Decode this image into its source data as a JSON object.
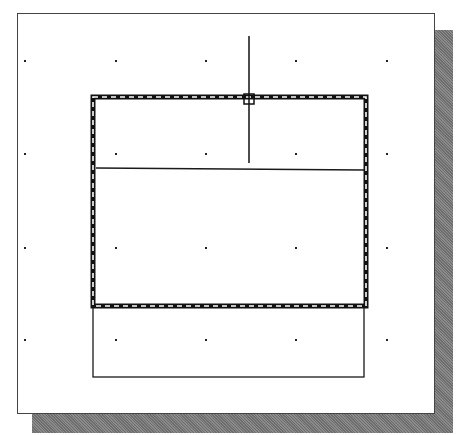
{
  "canvas": {
    "background": "#ffffff",
    "shadow_color": "#7a7a7a",
    "line_color": "#1a1a1a"
  },
  "grid": {
    "xs": [
      25,
      116,
      206,
      296,
      387
    ],
    "ys": [
      61,
      154,
      248,
      340
    ]
  },
  "selected_rectangle": {
    "x1": 93,
    "y1": 97,
    "x2": 366,
    "y2": 306,
    "style": "dashed-highlight"
  },
  "divider_line": {
    "x1": 96,
    "y1": 168,
    "x2": 364,
    "y2": 170
  },
  "lower_rectangle": {
    "x1": 93,
    "y1": 306,
    "x2": 364,
    "y2": 377
  },
  "cursor": {
    "type": "crosshair-pickbox",
    "x": 249,
    "y": 99,
    "vertical_top": 36,
    "vertical_bottom": 163
  }
}
